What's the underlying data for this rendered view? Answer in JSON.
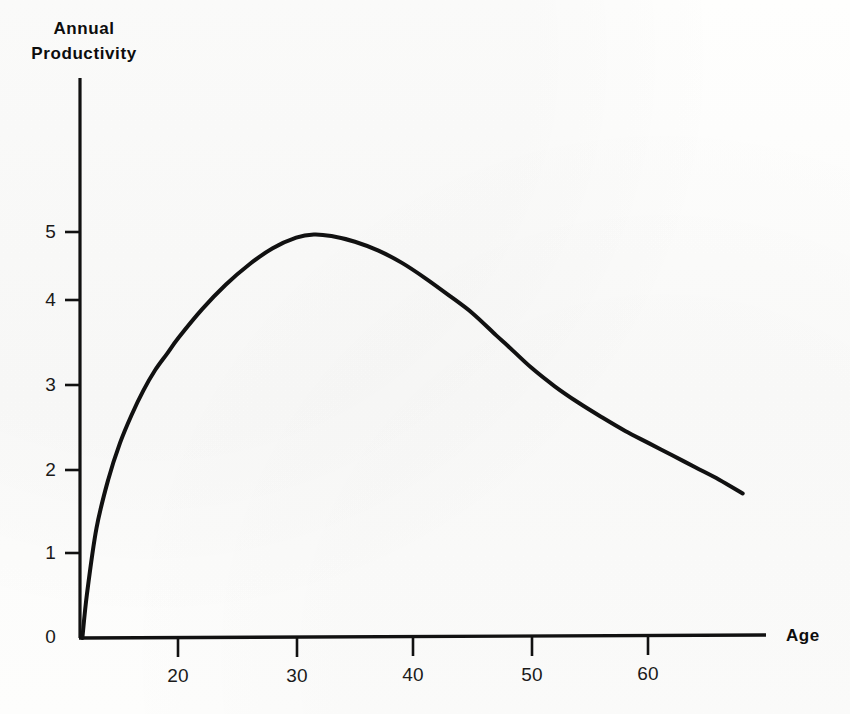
{
  "title": "Annual\nProductivity",
  "x_axis_label": "Age",
  "colors": {
    "ink": "#111111",
    "paper": "#fdfdfc"
  },
  "chart_data": {
    "type": "line",
    "title": "Annual Productivity",
    "xlabel": "Age",
    "ylabel": "Annual Productivity",
    "xlim": [
      11.6,
      68
    ],
    "ylim": [
      0,
      5.9
    ],
    "grid": false,
    "legend": null,
    "xticks": [
      20,
      30,
      40,
      50,
      60
    ],
    "yticks": [
      0,
      1,
      2,
      3,
      4,
      5
    ],
    "xtick_labels": [
      "20",
      "30",
      "40",
      "50",
      "60"
    ],
    "ytick_labels": [
      "0",
      "1",
      "2",
      "3",
      "4",
      "5"
    ],
    "series": [
      {
        "name": "Annual Productivity",
        "x": [
          11.8,
          12.2,
          13,
          14,
          15,
          16,
          17,
          18,
          19,
          20,
          22,
          24,
          26,
          28,
          30,
          31.5,
          33,
          35,
          37,
          39,
          41,
          43,
          45,
          47,
          48,
          50,
          52,
          54,
          56,
          58,
          60,
          62,
          64,
          66,
          68
        ],
        "y": [
          0.0,
          0.55,
          1.35,
          1.95,
          2.4,
          2.75,
          3.05,
          3.3,
          3.5,
          3.7,
          4.05,
          4.35,
          4.6,
          4.8,
          4.93,
          4.97,
          4.95,
          4.88,
          4.77,
          4.62,
          4.43,
          4.22,
          4.0,
          3.73,
          3.6,
          3.33,
          3.1,
          2.9,
          2.72,
          2.55,
          2.4,
          2.25,
          2.1,
          1.95,
          1.78
        ]
      }
    ],
    "annotations": [
      {
        "text": "peak",
        "x": 31.5,
        "y": 4.97
      }
    ]
  },
  "axes": {
    "y_axis_top_value": 5.9,
    "x_axis_end_value": 70.6
  }
}
